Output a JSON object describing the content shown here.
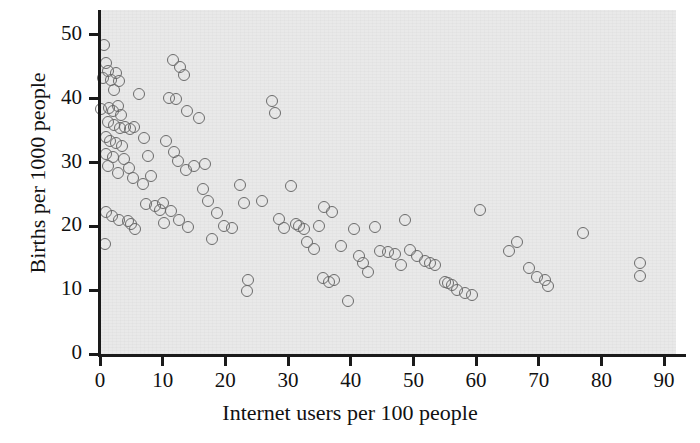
{
  "chart": {
    "type": "scatter",
    "title": "",
    "xlabel": "Internet users per 100 people",
    "ylabel": "Births per 1000 people",
    "background_color": "#e9e9e9",
    "marker_color": "#6b6b6b",
    "axis_color": "#1a1a1a"
  },
  "axes": {
    "x": {
      "min": 0,
      "max": 91.9,
      "ticks": [
        0,
        10,
        20,
        30,
        40,
        50,
        60,
        70,
        80,
        90
      ],
      "tick_labels": [
        "0",
        "10",
        "20",
        "30",
        "40",
        "50",
        "60",
        "70",
        "80",
        "90"
      ]
    },
    "y": {
      "min": 0,
      "max": 53.9,
      "ticks": [
        0,
        10,
        20,
        30,
        40,
        50
      ],
      "tick_labels": [
        "0",
        "10",
        "20",
        "30",
        "40",
        "50"
      ]
    },
    "grid": false,
    "legend": "none"
  },
  "chart_data": {
    "type": "scatter",
    "title": "",
    "xlabel": "Internet users per 100 people",
    "ylabel": "Births per 1000 people",
    "xlim": [
      0,
      91.9
    ],
    "ylim": [
      0,
      53.9
    ],
    "xticks": [
      0,
      10,
      20,
      30,
      40,
      50,
      60,
      70,
      80,
      90
    ],
    "yticks": [
      0,
      10,
      20,
      30,
      40,
      50
    ],
    "grid": false,
    "legend": "none",
    "series": [
      {
        "name": "Countries",
        "marker": "open-circle",
        "color": "#6b6b6b",
        "points": [
          [
            0.6,
            48.4
          ],
          [
            1.0,
            45.6
          ],
          [
            1.3,
            44.3
          ],
          [
            0.5,
            43.2
          ],
          [
            1.7,
            43.0
          ],
          [
            2.6,
            44.1
          ],
          [
            3.0,
            42.8
          ],
          [
            2.2,
            41.4
          ],
          [
            0.2,
            38.4
          ],
          [
            1.4,
            38.6
          ],
          [
            2.0,
            38.0
          ],
          [
            2.9,
            38.8
          ],
          [
            3.4,
            37.4
          ],
          [
            1.2,
            36.3
          ],
          [
            2.3,
            35.9
          ],
          [
            3.2,
            35.4
          ],
          [
            4.0,
            35.6
          ],
          [
            4.8,
            35.3
          ],
          [
            5.4,
            35.6
          ],
          [
            1.0,
            34.0
          ],
          [
            1.6,
            33.4
          ],
          [
            2.5,
            33.1
          ],
          [
            3.5,
            32.6
          ],
          [
            0.9,
            31.3
          ],
          [
            2.1,
            30.9
          ],
          [
            3.8,
            30.6
          ],
          [
            1.2,
            29.4
          ],
          [
            2.8,
            28.3
          ],
          [
            4.6,
            29.2
          ],
          [
            5.2,
            27.6
          ],
          [
            0.9,
            22.2
          ],
          [
            1.9,
            21.6
          ],
          [
            3.1,
            21.0
          ],
          [
            4.4,
            20.8
          ],
          [
            5.0,
            20.3
          ],
          [
            5.6,
            19.6
          ],
          [
            0.8,
            17.2
          ],
          [
            6.3,
            40.8
          ],
          [
            7.0,
            33.9
          ],
          [
            7.6,
            31.1
          ],
          [
            6.8,
            26.6
          ],
          [
            8.2,
            27.9
          ],
          [
            7.4,
            23.5
          ],
          [
            8.8,
            23.2
          ],
          [
            9.6,
            22.6
          ],
          [
            10.2,
            20.6
          ],
          [
            11.6,
            46.1
          ],
          [
            12.8,
            45.0
          ],
          [
            13.4,
            43.7
          ],
          [
            11.0,
            40.1
          ],
          [
            12.2,
            39.9
          ],
          [
            13.9,
            38.1
          ],
          [
            15.8,
            36.9
          ],
          [
            10.6,
            33.3
          ],
          [
            11.8,
            31.6
          ],
          [
            12.4,
            30.2
          ],
          [
            13.8,
            28.9
          ],
          [
            10.0,
            23.6
          ],
          [
            11.4,
            22.4
          ],
          [
            12.6,
            21.0
          ],
          [
            14.0,
            19.9
          ],
          [
            15.0,
            29.4
          ],
          [
            16.4,
            25.9
          ],
          [
            17.2,
            24.0
          ],
          [
            17.8,
            18.0
          ],
          [
            18.6,
            22.1
          ],
          [
            19.8,
            20.1
          ],
          [
            16.8,
            29.7
          ],
          [
            21.0,
            19.8
          ],
          [
            22.4,
            26.5
          ],
          [
            23.0,
            23.6
          ],
          [
            23.6,
            11.6
          ],
          [
            23.4,
            9.8
          ],
          [
            25.8,
            24.0
          ],
          [
            27.4,
            39.6
          ],
          [
            28.0,
            37.8
          ],
          [
            28.6,
            21.1
          ],
          [
            29.4,
            19.8
          ],
          [
            30.4,
            26.3
          ],
          [
            31.2,
            20.4
          ],
          [
            31.8,
            20.1
          ],
          [
            32.6,
            19.6
          ],
          [
            33.0,
            17.6
          ],
          [
            34.2,
            16.5
          ],
          [
            35.0,
            20.0
          ],
          [
            35.6,
            11.9
          ],
          [
            36.6,
            11.3
          ],
          [
            37.4,
            11.6
          ],
          [
            35.8,
            23.0
          ],
          [
            37.0,
            22.2
          ],
          [
            38.4,
            16.9
          ],
          [
            39.6,
            8.3
          ],
          [
            40.6,
            19.6
          ],
          [
            41.4,
            15.4
          ],
          [
            42.0,
            14.2
          ],
          [
            42.8,
            12.9
          ],
          [
            43.8,
            19.9
          ],
          [
            44.6,
            16.2
          ],
          [
            46.0,
            16.0
          ],
          [
            47.0,
            15.7
          ],
          [
            48.0,
            13.9
          ],
          [
            48.6,
            21.0
          ],
          [
            49.4,
            16.3
          ],
          [
            50.6,
            15.4
          ],
          [
            51.8,
            14.5
          ],
          [
            52.6,
            14.3
          ],
          [
            53.4,
            14.0
          ],
          [
            55.0,
            11.3
          ],
          [
            55.6,
            11.1
          ],
          [
            56.2,
            10.8
          ],
          [
            57.0,
            10.0
          ],
          [
            58.2,
            9.6
          ],
          [
            59.4,
            9.3
          ],
          [
            60.6,
            22.6
          ],
          [
            65.2,
            16.2
          ],
          [
            66.6,
            17.5
          ],
          [
            68.4,
            13.4
          ],
          [
            69.8,
            12.1
          ],
          [
            71.0,
            11.6
          ],
          [
            71.4,
            10.7
          ],
          [
            77.0,
            19.0
          ],
          [
            86.2,
            14.2
          ],
          [
            86.2,
            12.2
          ]
        ]
      }
    ]
  }
}
